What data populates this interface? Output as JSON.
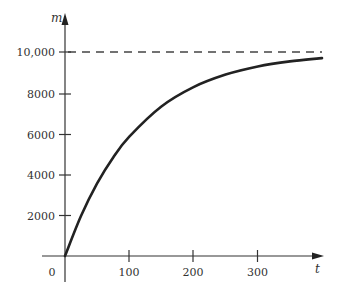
{
  "chart_data": {
    "type": "line",
    "title": "",
    "xlabel": "t",
    "ylabel": "m",
    "xlim": [
      -35,
      400
    ],
    "ylim": [
      0,
      10000
    ],
    "x_ticks": [
      100,
      200,
      300
    ],
    "x_tick_labels": [
      "100",
      "200",
      "300"
    ],
    "origin_label": "0",
    "y_ticks": [
      2000,
      4000,
      6000,
      8000,
      10000
    ],
    "y_tick_labels": [
      "2000",
      "4000",
      "6000",
      "8000",
      "10,000"
    ],
    "grid": false,
    "legend": null,
    "asymptote": {
      "y": 10000,
      "style": "dashed"
    },
    "series": [
      {
        "name": "m(t)",
        "x": [
          0,
          25,
          50,
          75,
          100,
          150,
          200,
          250,
          300,
          350,
          400
        ],
        "y": [
          0,
          1970,
          3560,
          4830,
          5850,
          7330,
          8280,
          8890,
          9290,
          9540,
          9700
        ]
      }
    ]
  },
  "labels": {
    "y_axis": "m",
    "x_axis": "t",
    "origin": "0",
    "y_ticks": [
      "2000",
      "4000",
      "6000",
      "8000",
      "10,000"
    ],
    "x_ticks": [
      "100",
      "200",
      "300"
    ]
  }
}
